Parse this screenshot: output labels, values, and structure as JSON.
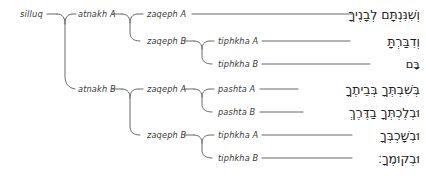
{
  "diagram": {
    "type": "tree",
    "line_color": "#58585a",
    "text_color": "#3a3a3a",
    "hebrew_color": "#1d1d1d",
    "background": "#ffffff"
  },
  "nodes": {
    "root": {
      "label": "silluq",
      "x": 20,
      "y": 14
    },
    "level1": [
      {
        "label": "atnakh A",
        "x": 78,
        "y": 14
      },
      {
        "label": "atnakh B",
        "x": 78,
        "y": 89
      }
    ],
    "level2": [
      {
        "label": "zaqeph A",
        "x": 147,
        "y": 14
      },
      {
        "label": "zaqeph B",
        "x": 147,
        "y": 41
      },
      {
        "label": "zaqeph A",
        "x": 147,
        "y": 89
      },
      {
        "label": "zaqeph B",
        "x": 147,
        "y": 135
      }
    ],
    "level3": [
      {
        "label": "tiphkha A",
        "x": 218,
        "y": 41
      },
      {
        "label": "tiphkha B",
        "x": 218,
        "y": 64
      },
      {
        "label": "pashta A",
        "x": 218,
        "y": 89
      },
      {
        "label": "pashta B",
        "x": 218,
        "y": 112
      },
      {
        "label": "tiphkha A",
        "x": 218,
        "y": 135
      },
      {
        "label": "tiphkha B",
        "x": 218,
        "y": 158
      }
    ]
  },
  "hebrew_rows": [
    {
      "text": "וְשִׁנִּנְתָּם לְבָנֶיךָ",
      "y": 14
    },
    {
      "text": "וְדִבַּרְתָּ",
      "y": 41
    },
    {
      "text": "בָּם",
      "y": 64
    },
    {
      "text": "בְּשִׁבְתְּךָ בְּבֵיתֶךָ",
      "y": 89
    },
    {
      "text": "וּבְלֶכְתְּךָ בַדֶּרֶךְ",
      "y": 112
    },
    {
      "text": "וּבְשָׁכְבְּךָ",
      "y": 135
    },
    {
      "text": "וּבְקוּמֶךָ׃",
      "y": 158
    }
  ]
}
